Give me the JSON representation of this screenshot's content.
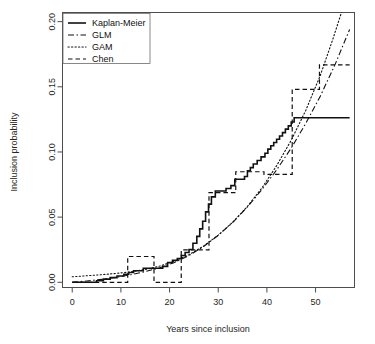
{
  "figure": {
    "title": "",
    "background_color": "#ffffff",
    "foreground_color": "#111111"
  },
  "chart_data": {
    "type": "line",
    "title": "",
    "subtitle": "",
    "xlabel": "Years since inclusion",
    "ylabel": "Inclusion probability",
    "xlim": [
      -2.0,
      58.0
    ],
    "ylim": [
      -0.004,
      0.207
    ],
    "xticks": [
      0,
      10,
      20,
      30,
      40,
      50
    ],
    "xtick_labels": [
      "0",
      "10",
      "20",
      "30",
      "40",
      "50"
    ],
    "yticks": [
      0.0,
      0.05,
      0.1,
      0.15,
      0.2
    ],
    "ytick_labels": [
      "0.00",
      "0.05",
      "0.10",
      "0.15",
      "0.20"
    ],
    "grid": false,
    "legend_position": "top-left",
    "legend_entries": [
      {
        "label": "Kaplan-Meier",
        "style": "solid"
      },
      {
        "label": "GLM",
        "style": "dashdot"
      },
      {
        "label": "GAM",
        "style": "dotted"
      },
      {
        "label": "Chen",
        "style": "dashed"
      }
    ],
    "series": [
      {
        "name": "Kaplan-Meier",
        "style": "solid",
        "step": true,
        "points": [
          [
            0.0,
            0.0
          ],
          [
            5.0,
            0.0
          ],
          [
            5.0,
            0.0012
          ],
          [
            6.4,
            0.0012
          ],
          [
            6.4,
            0.0024
          ],
          [
            7.8,
            0.0024
          ],
          [
            7.8,
            0.0036
          ],
          [
            9.2,
            0.0036
          ],
          [
            9.2,
            0.0048
          ],
          [
            10.6,
            0.0048
          ],
          [
            10.6,
            0.0062
          ],
          [
            11.6,
            0.0062
          ],
          [
            11.6,
            0.0075
          ],
          [
            12.6,
            0.0075
          ],
          [
            12.6,
            0.0088
          ],
          [
            14.6,
            0.0088
          ],
          [
            14.6,
            0.0108
          ],
          [
            18.6,
            0.0108
          ],
          [
            18.6,
            0.0122
          ],
          [
            19.6,
            0.0122
          ],
          [
            19.6,
            0.0152
          ],
          [
            20.6,
            0.0152
          ],
          [
            20.6,
            0.0168
          ],
          [
            21.6,
            0.0168
          ],
          [
            21.6,
            0.0182
          ],
          [
            22.4,
            0.0182
          ],
          [
            22.4,
            0.0206
          ],
          [
            23.2,
            0.0206
          ],
          [
            23.2,
            0.0228
          ],
          [
            24.0,
            0.0228
          ],
          [
            24.0,
            0.0252
          ],
          [
            24.8,
            0.0252
          ],
          [
            24.8,
            0.03
          ],
          [
            25.6,
            0.03
          ],
          [
            25.6,
            0.0352
          ],
          [
            26.2,
            0.0352
          ],
          [
            26.2,
            0.041
          ],
          [
            26.8,
            0.041
          ],
          [
            26.8,
            0.0468
          ],
          [
            27.4,
            0.0468
          ],
          [
            27.4,
            0.054
          ],
          [
            28.0,
            0.054
          ],
          [
            28.0,
            0.06
          ],
          [
            28.6,
            0.06
          ],
          [
            28.6,
            0.0655
          ],
          [
            29.4,
            0.0655
          ],
          [
            29.4,
            0.07
          ],
          [
            31.6,
            0.07
          ],
          [
            31.6,
            0.072
          ],
          [
            32.6,
            0.072
          ],
          [
            32.6,
            0.0742
          ],
          [
            33.4,
            0.0742
          ],
          [
            33.4,
            0.079
          ],
          [
            35.4,
            0.079
          ],
          [
            35.4,
            0.0812
          ],
          [
            36.0,
            0.0812
          ],
          [
            36.0,
            0.0856
          ],
          [
            36.6,
            0.0856
          ],
          [
            36.6,
            0.088
          ],
          [
            37.2,
            0.088
          ],
          [
            37.2,
            0.0908
          ],
          [
            38.0,
            0.0908
          ],
          [
            38.0,
            0.0935
          ],
          [
            38.8,
            0.0935
          ],
          [
            38.8,
            0.0962
          ],
          [
            39.6,
            0.0962
          ],
          [
            39.6,
            0.099
          ],
          [
            40.2,
            0.099
          ],
          [
            40.2,
            0.1022
          ],
          [
            40.8,
            0.1022
          ],
          [
            40.8,
            0.1048
          ],
          [
            41.4,
            0.1048
          ],
          [
            41.4,
            0.1072
          ],
          [
            42.0,
            0.1072
          ],
          [
            42.0,
            0.1098
          ],
          [
            42.6,
            0.1098
          ],
          [
            42.6,
            0.1122
          ],
          [
            43.2,
            0.1122
          ],
          [
            43.2,
            0.1148
          ],
          [
            43.8,
            0.1148
          ],
          [
            43.8,
            0.1175
          ],
          [
            44.4,
            0.1175
          ],
          [
            44.4,
            0.12
          ],
          [
            45.0,
            0.12
          ],
          [
            45.0,
            0.123
          ],
          [
            45.6,
            0.123
          ],
          [
            45.6,
            0.1262
          ],
          [
            57.0,
            0.1262
          ]
        ]
      },
      {
        "name": "GLM",
        "style": "dashdot",
        "step": false,
        "points": [
          [
            0.0,
            0.0
          ],
          [
            3.0,
            0.001
          ],
          [
            6.0,
            0.0022
          ],
          [
            9.0,
            0.0038
          ],
          [
            12.0,
            0.0058
          ],
          [
            15.0,
            0.0082
          ],
          [
            18.0,
            0.0112
          ],
          [
            21.0,
            0.0152
          ],
          [
            24.0,
            0.0205
          ],
          [
            27.0,
            0.0275
          ],
          [
            30.0,
            0.036
          ],
          [
            33.0,
            0.046
          ],
          [
            36.0,
            0.0578
          ],
          [
            39.0,
            0.0712
          ],
          [
            42.0,
            0.0862
          ],
          [
            45.0,
            0.103
          ],
          [
            48.0,
            0.122
          ],
          [
            51.0,
            0.143
          ],
          [
            54.0,
            0.167
          ],
          [
            57.0,
            0.194
          ]
        ]
      },
      {
        "name": "GAM",
        "style": "dotted",
        "step": false,
        "points": [
          [
            0.0,
            0.0042
          ],
          [
            3.0,
            0.005
          ],
          [
            6.0,
            0.0058
          ],
          [
            9.0,
            0.0068
          ],
          [
            12.0,
            0.008
          ],
          [
            15.0,
            0.0098
          ],
          [
            18.0,
            0.0125
          ],
          [
            21.0,
            0.0162
          ],
          [
            24.0,
            0.0212
          ],
          [
            27.0,
            0.0278
          ],
          [
            30.0,
            0.0362
          ],
          [
            33.0,
            0.0462
          ],
          [
            36.0,
            0.0582
          ],
          [
            39.0,
            0.0725
          ],
          [
            42.0,
            0.0895
          ],
          [
            45.0,
            0.109
          ],
          [
            48.0,
            0.132
          ],
          [
            51.0,
            0.159
          ],
          [
            53.5,
            0.186
          ],
          [
            55.5,
            0.209
          ]
        ]
      },
      {
        "name": "Chen",
        "style": "dashed",
        "step": true,
        "points": [
          [
            0.0,
            0.0
          ],
          [
            11.4,
            0.0
          ],
          [
            11.4,
            0.0198
          ],
          [
            16.8,
            0.0198
          ],
          [
            16.8,
            0.0
          ],
          [
            22.4,
            0.0
          ],
          [
            22.4,
            0.0248
          ],
          [
            28.1,
            0.0248
          ],
          [
            28.1,
            0.0688
          ],
          [
            33.6,
            0.0688
          ],
          [
            33.6,
            0.0848
          ],
          [
            39.4,
            0.0848
          ],
          [
            39.4,
            0.0828
          ],
          [
            45.2,
            0.0828
          ],
          [
            45.2,
            0.148
          ],
          [
            50.8,
            0.148
          ],
          [
            50.8,
            0.1668
          ],
          [
            57.0,
            0.1668
          ]
        ]
      }
    ]
  }
}
